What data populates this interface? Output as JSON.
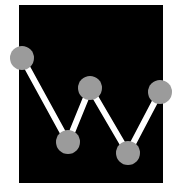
{
  "icon": {
    "name": "line-chart-icon",
    "background_color": "#000000",
    "line_color": "#ffffff",
    "node_color": "#9b9b9b",
    "panel": {
      "x": 19,
      "y": 5,
      "width": 144,
      "height": 178
    },
    "node_radius": 12,
    "line_width": 6,
    "nodes": [
      {
        "x": 22,
        "y": 58
      },
      {
        "x": 68,
        "y": 142
      },
      {
        "x": 90,
        "y": 88
      },
      {
        "x": 128,
        "y": 153
      },
      {
        "x": 160,
        "y": 92
      }
    ]
  }
}
